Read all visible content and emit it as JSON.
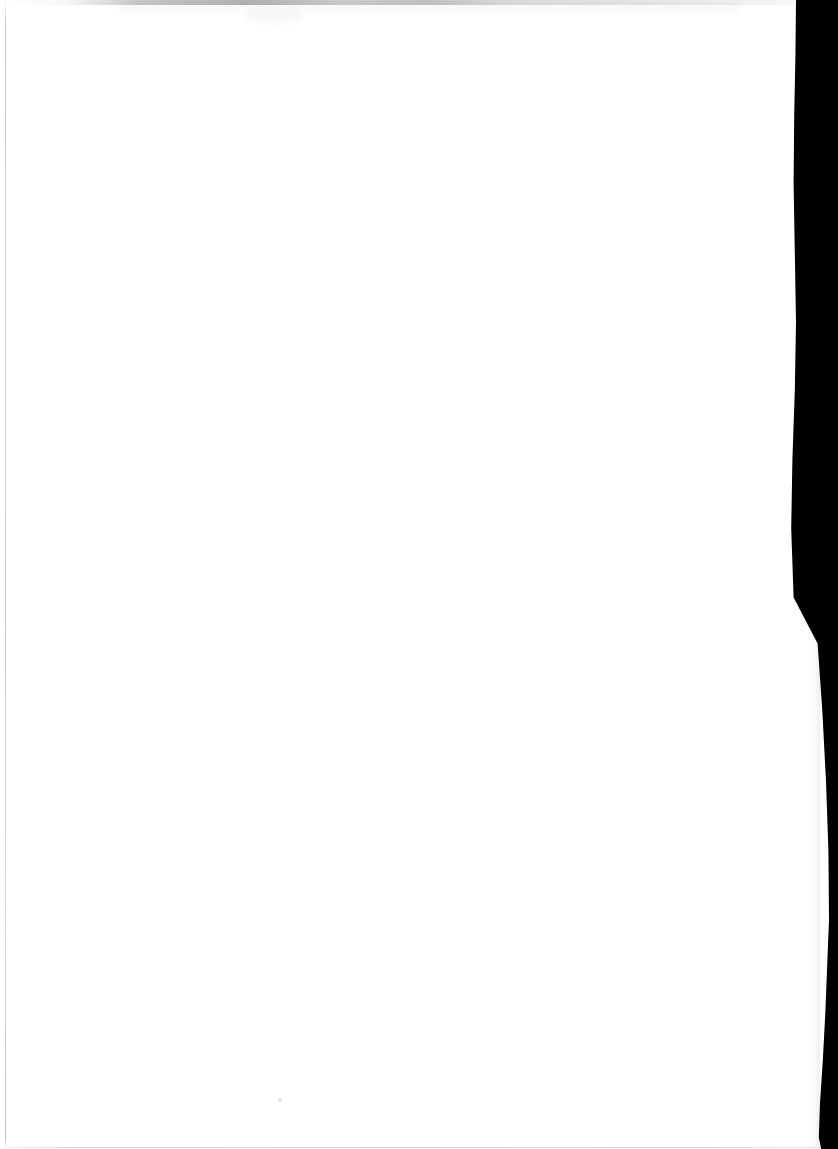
{
  "document": {
    "kind": "scanned-page",
    "page_label": "",
    "body_text": "",
    "is_blank": true,
    "empty_note": "Blank scanned page — no printed text or figures present."
  },
  "canvas": {
    "width_px": 838,
    "height_px": 1149,
    "background_color": "#ffffff"
  },
  "artifacts": {
    "scanner_band": {
      "name": "right-edge scanner background",
      "color": "#000000",
      "side": "right",
      "start_x_top_px": 818,
      "start_x_middle_px": 813,
      "start_x_lower_px": 829
    },
    "left_edge_rule": {
      "name": "left edge rule",
      "color": "#b4b4b4",
      "x_px": 5
    },
    "top_edge_smudge": {
      "name": "top edge smudge",
      "color": "#9a9a9a",
      "y_px": 0,
      "height_px": 5
    },
    "bottom_edge_rule": {
      "name": "bottom edge rule",
      "color": "#bdbdbd",
      "y_px": 1147
    },
    "dust_speck": {
      "name": "dust speck",
      "color": "#e0e0e0",
      "x_px": 280,
      "y_px": 1100
    }
  }
}
